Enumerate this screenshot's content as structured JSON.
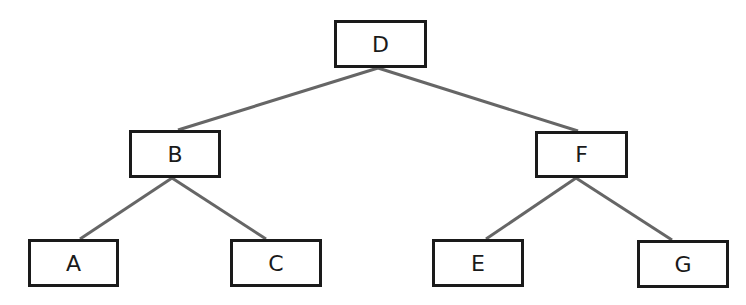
{
  "diagram": {
    "type": "binary-search-tree",
    "edge_color": "#666666",
    "border_color": "#1a1a1a",
    "nodes": [
      {
        "id": "D",
        "label": "D",
        "x": 334,
        "y": 20,
        "w": 93,
        "h": 48
      },
      {
        "id": "B",
        "label": "B",
        "x": 129,
        "y": 130,
        "w": 92,
        "h": 48
      },
      {
        "id": "F",
        "label": "F",
        "x": 535,
        "y": 131,
        "w": 93,
        "h": 47
      },
      {
        "id": "A",
        "label": "A",
        "x": 28,
        "y": 239,
        "w": 91,
        "h": 48
      },
      {
        "id": "C",
        "label": "C",
        "x": 230,
        "y": 239,
        "w": 92,
        "h": 48
      },
      {
        "id": "E",
        "label": "E",
        "x": 432,
        "y": 239,
        "w": 92,
        "h": 48
      },
      {
        "id": "G",
        "label": "G",
        "x": 637,
        "y": 240,
        "w": 92,
        "h": 48
      }
    ],
    "edges": [
      {
        "from": "D",
        "to": "B"
      },
      {
        "from": "D",
        "to": "F"
      },
      {
        "from": "B",
        "to": "A"
      },
      {
        "from": "B",
        "to": "C"
      },
      {
        "from": "F",
        "to": "E"
      },
      {
        "from": "F",
        "to": "G"
      }
    ]
  }
}
